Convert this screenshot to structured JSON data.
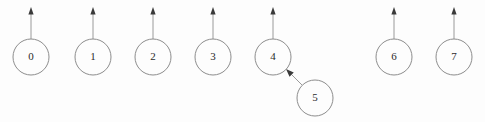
{
  "diagram": {
    "background_color": "#fdfdfd",
    "node_stroke_color": "#8d8d8d",
    "edge_stroke_color": "#9a9a9a",
    "arrow_head_color": "#3a3a3a",
    "label_color": "#2b2b2b",
    "node_radius": 18,
    "row_y": 57,
    "nodes": [
      {
        "id": "node-0",
        "label": "0",
        "cx": 31,
        "cy": 57
      },
      {
        "id": "node-1",
        "label": "1",
        "cx": 93,
        "cy": 57
      },
      {
        "id": "node-2",
        "label": "2",
        "cx": 153,
        "cy": 57
      },
      {
        "id": "node-3",
        "label": "3",
        "cx": 213,
        "cy": 57
      },
      {
        "id": "node-4",
        "label": "4",
        "cx": 273,
        "cy": 57
      },
      {
        "id": "node-5",
        "label": "5",
        "cx": 315,
        "cy": 98
      },
      {
        "id": "node-6",
        "label": "6",
        "cx": 394,
        "cy": 57
      },
      {
        "id": "node-7",
        "label": "7",
        "cx": 454,
        "cy": 57
      }
    ],
    "up_arrows": [
      {
        "id": "arrow-up-0",
        "from_node": "0",
        "x": 31,
        "y_start": 39,
        "y_end": 7
      },
      {
        "id": "arrow-up-1",
        "from_node": "1",
        "x": 93,
        "y_start": 39,
        "y_end": 7
      },
      {
        "id": "arrow-up-2",
        "from_node": "2",
        "x": 153,
        "y_start": 39,
        "y_end": 7
      },
      {
        "id": "arrow-up-3",
        "from_node": "3",
        "x": 213,
        "y_start": 39,
        "y_end": 7
      },
      {
        "id": "arrow-up-4",
        "from_node": "4",
        "x": 273,
        "y_start": 39,
        "y_end": 7
      },
      {
        "id": "arrow-up-6",
        "from_node": "6",
        "x": 394,
        "y_start": 39,
        "y_end": 7
      },
      {
        "id": "arrow-up-7",
        "from_node": "7",
        "x": 454,
        "y_start": 39,
        "y_end": 7
      }
    ],
    "diagonal_arrows": [
      {
        "id": "arrow-5-to-4",
        "from_node": "5",
        "to_node": "4",
        "x_start": 302,
        "y_start": 85,
        "x_end": 286,
        "y_end": 69
      }
    ],
    "empty_slot": {
      "id": "empty-slot",
      "cx": 333,
      "cy": 57
    }
  }
}
